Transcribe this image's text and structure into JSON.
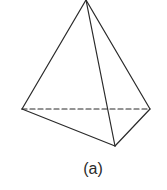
{
  "figure": {
    "caption": "(a)",
    "shape": "tetrahedron",
    "stroke_color": "#2a2a2a",
    "vertices": {
      "apex": [
        86,
        0
      ],
      "left": [
        22,
        109
      ],
      "right": [
        150,
        109
      ],
      "front": [
        115,
        146
      ]
    },
    "edges": [
      {
        "from": "apex",
        "to": "left",
        "style": "solid"
      },
      {
        "from": "apex",
        "to": "right",
        "style": "solid"
      },
      {
        "from": "apex",
        "to": "front",
        "style": "solid"
      },
      {
        "from": "left",
        "to": "front",
        "style": "solid"
      },
      {
        "from": "front",
        "to": "right",
        "style": "solid"
      },
      {
        "from": "left",
        "to": "right",
        "style": "dashed"
      }
    ]
  }
}
